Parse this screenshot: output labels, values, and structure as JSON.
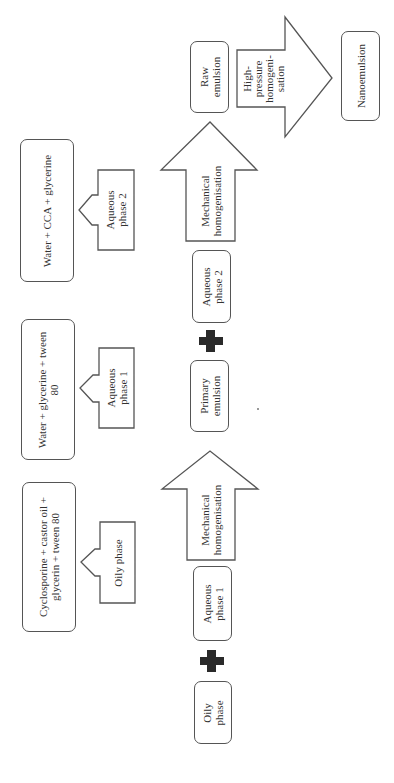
{
  "diagram": {
    "orientation": "rotated 90 degrees counter-clockwise",
    "ingredients": {
      "aqueous_phase_2": "Water + CCA + glycerine",
      "aqueous_phase_1": "Water + glycerine + tween 80",
      "oily_phase": "Cyclosporine + castor oil + glycerin + tween 80"
    },
    "phase_labels": {
      "aqueous_phase_2": "Aqueous phase 2",
      "aqueous_phase_1": "Aqueous phase 1",
      "oily_phase": "Oily phase"
    },
    "process": {
      "oily_phase": "Oily phase",
      "plus_1": "+",
      "aqueous_phase_1": "Aqueous phase 1",
      "step_1": "Mechanical homogenisation",
      "primary_emulsion": "Primary emulsion",
      "plus_2": "+",
      "aqueous_phase_2": "Aqueous phase 2",
      "step_2": "Mechanical homogenisation",
      "raw_emulsion": "Raw emulsion",
      "step_3": "High-pressure homogenisation",
      "nanoemulsion": "Nanoemulsion"
    },
    "text_lines": {
      "aq2_ingredients": [
        "Water + CCA + glycerine"
      ],
      "aq1_ingredients": [
        "Water + glycerine + tween",
        "80"
      ],
      "oily_ingredients": [
        "Cyclosporine + castor oil +",
        "glycerin + tween 80"
      ],
      "aq2_label": [
        "Aqueous",
        "phase 2"
      ],
      "aq1_label": [
        "Aqueous",
        "phase 1"
      ],
      "oily_label": [
        "Oily phase"
      ],
      "oily_box": [
        "Oily",
        "phase"
      ],
      "aq1_box": [
        "Aqueous",
        "phase 1"
      ],
      "mech_1": [
        "Mechanical",
        "homogenisation"
      ],
      "primary_box": [
        "Primary",
        "emulsion"
      ],
      "aq2_box": [
        "Aqueous",
        "phase 2"
      ],
      "mech_2": [
        "Mechanical",
        "homogenisation"
      ],
      "raw_box": [
        "Raw",
        "emulsion"
      ],
      "hp_arrow": [
        "High-",
        "pressure",
        "homogeni-",
        "sation"
      ],
      "nano_box": [
        "Nanoemulsion"
      ]
    }
  }
}
